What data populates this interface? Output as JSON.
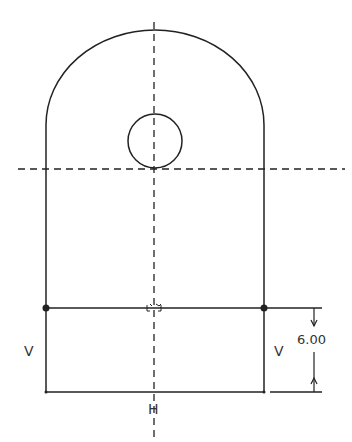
{
  "diagram": {
    "type": "CAD sketch with constraints",
    "colors": {
      "line": "#222222",
      "background": "#ffffff"
    },
    "constraints": {
      "left_vertical": "V",
      "right_vertical": "V",
      "bottom_horizontal": "H"
    },
    "dimension": {
      "value": "6.00"
    }
  }
}
